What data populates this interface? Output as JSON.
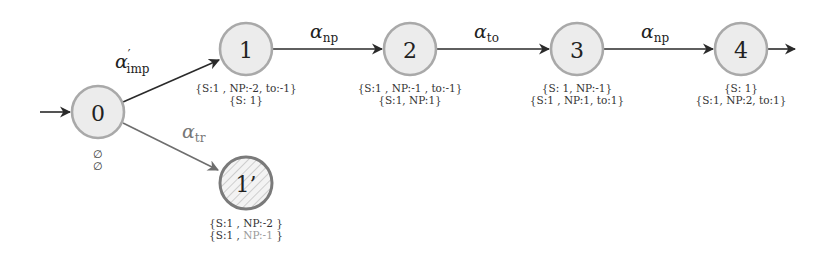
{
  "diagram": {
    "type": "state-transition-automaton",
    "initial_arrow": true,
    "nodes": [
      {
        "id": "0",
        "label": "0",
        "cx": 98,
        "cy": 112,
        "hatched": false,
        "annotations": [
          "∅",
          "∅"
        ]
      },
      {
        "id": "1",
        "label": "1",
        "cx": 246,
        "cy": 49,
        "hatched": false,
        "annotations": [
          "{S:1 , NP:-2, to:-1}",
          "{S: 1}"
        ]
      },
      {
        "id": "2",
        "label": "2",
        "cx": 410,
        "cy": 49,
        "hatched": false,
        "annotations": [
          "{S:1 , NP:-1 , to:-1}",
          "{S:1, NP:1}"
        ]
      },
      {
        "id": "3",
        "label": "3",
        "cx": 577,
        "cy": 49,
        "hatched": false,
        "annotations": [
          "{S: 1, NP:-1}",
          "{S:1 , NP:1, to:1}"
        ]
      },
      {
        "id": "4",
        "label": "4",
        "cx": 741,
        "cy": 49,
        "hatched": false,
        "annotations": [
          "{S: 1}",
          "{S:1, NP:2, to:1}"
        ]
      },
      {
        "id": "1p",
        "label": "1’",
        "cx": 246,
        "cy": 183,
        "hatched": true,
        "annotations": [
          "{S:1 , NP:-2 }",
          "{S:1 , NP:-1 }"
        ],
        "annotation_faded_part": "NP:-1"
      }
    ],
    "edges": [
      {
        "from": "0",
        "to": "1",
        "symbol": "α",
        "prime": "′",
        "subscript": "imp",
        "color": "#2a2a2a"
      },
      {
        "from": "1",
        "to": "2",
        "symbol": "α",
        "prime": "",
        "subscript": "np",
        "color": "#2a2a2a"
      },
      {
        "from": "2",
        "to": "3",
        "symbol": "α",
        "prime": "",
        "subscript": "to",
        "color": "#2a2a2a"
      },
      {
        "from": "3",
        "to": "4",
        "symbol": "α",
        "prime": "",
        "subscript": "np",
        "color": "#2a2a2a"
      },
      {
        "from": "0",
        "to": "1p",
        "symbol": "α",
        "prime": "",
        "subscript": "tr",
        "color": "#6e6e6e"
      }
    ],
    "final_arrow_from": "4",
    "colors": {
      "node_fill": "#ececec",
      "node_stroke": "#a9a9a9",
      "hatched_stroke": "#7a7a7a",
      "edge": "#2a2a2a",
      "edge_gray": "#6e6e6e",
      "faded_text": "#9a9a9a"
    }
  },
  "labels": {
    "n0": "0",
    "n1": "1",
    "n2": "2",
    "n3": "3",
    "n4": "4",
    "n1p": "1’",
    "alpha": "α",
    "prime": "′",
    "sub_imp": "imp",
    "sub_np": "np",
    "sub_to": "to",
    "sub_tr": "tr",
    "a0_1": "∅",
    "a0_2": "∅",
    "a1_1": "{S:1 , NP:-2, to:-1}",
    "a1_2": "{S: 1}",
    "a2_1": "{S:1 , NP:-1 , to:-1}",
    "a2_2": "{S:1, NP:1}",
    "a3_1": "{S: 1, NP:-1}",
    "a3_2": "{S:1 , NP:1, to:1}",
    "a4_1": "{S: 1}",
    "a4_2": "{S:1, NP:2, to:1}",
    "a1p_1": "{S:1 , NP:-2 }",
    "a1p_2_pre": "{S:1 , ",
    "a1p_2_faded": "NP:-1",
    "a1p_2_post": " }"
  }
}
